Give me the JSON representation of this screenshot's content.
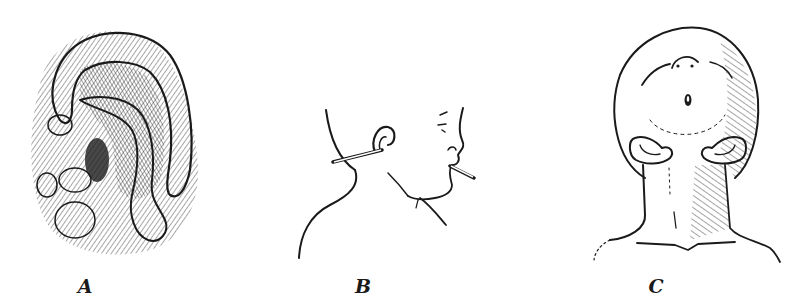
{
  "figure": {
    "panels": [
      {
        "id": "A",
        "label": "A",
        "subject": "ear-detail-hatched"
      },
      {
        "id": "B",
        "label": "B",
        "subject": "infant-profile-with-tubes"
      },
      {
        "id": "C",
        "label": "C",
        "subject": "head-front-view-tilted-up"
      }
    ],
    "colors": {
      "ink": "#1a1a1a",
      "background": "#ffffff"
    }
  }
}
